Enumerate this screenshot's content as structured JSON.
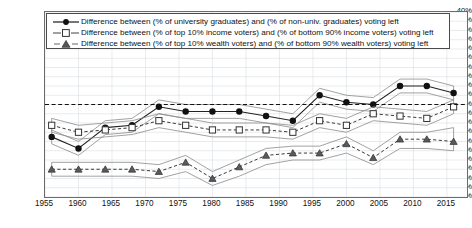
{
  "legend": {
    "entries": [
      {
        "label": "Difference between (% of university graduates) and (% of non-univ. graduates) voting left",
        "marker": "filled-circle-icon",
        "line": "solid"
      },
      {
        "label": "Difference between (% of top 10% income voters) and (% of bottom 90% income voters) voting left",
        "marker": "open-square-icon",
        "line": "dashed"
      },
      {
        "label": "Difference between (% of top 10% wealth voters) and (% of bottom 90% wealth voters) voting left",
        "marker": "filled-triangle-icon",
        "line": "dashed"
      }
    ],
    "position": "top-left-inside"
  },
  "axes": {
    "y_ticks": [
      "40%",
      "36%",
      "32%",
      "28%",
      "24%",
      "20%",
      "16%",
      "12%",
      "8%",
      "4%",
      "0%",
      "-4%",
      "-8%",
      "-12%",
      "-16%",
      "-20%",
      "-24%",
      "-28%",
      "-32%",
      "-36%",
      "-40%"
    ],
    "x_ticks": [
      "1955",
      "1960",
      "1965",
      "1970",
      "1975",
      "1980",
      "1985",
      "1990",
      "1995",
      "2000",
      "2005",
      "2010",
      "2015"
    ]
  },
  "chart_data": {
    "type": "line",
    "title": "",
    "xlabel": "",
    "ylabel": "",
    "ylim": [
      -40,
      40
    ],
    "xlim": [
      1955,
      2018
    ],
    "ytick_step": 4,
    "grid": true,
    "zero_line": true,
    "zero_line_style": "dashed",
    "legend_position": "top-left-inside",
    "colors": {
      "line": "#222222",
      "band": "#8a8a8a",
      "grid": "#d9dde3",
      "frame": "#6b6b6b"
    },
    "series": [
      {
        "name": "Difference between (% of university graduates) and (% of non-univ. graduates) voting left",
        "marker": "filled-circle",
        "line": "solid",
        "x": [
          1956,
          1960,
          1964,
          1968,
          1972,
          1976,
          1980,
          1984,
          1988,
          1992,
          1996,
          2000,
          2004,
          2008,
          2012,
          2016
        ],
        "values": [
          -14,
          -19,
          -10,
          -9,
          -1,
          -3,
          -3,
          -3,
          -5,
          -7,
          4,
          1,
          0,
          8,
          8,
          5
        ],
        "band_upper": [
          -11,
          -16,
          -7,
          -6,
          2,
          0,
          0,
          0,
          -2,
          -4,
          7,
          4,
          3,
          11,
          11,
          8
        ],
        "band_lower": [
          -17,
          -22,
          -13,
          -12,
          -4,
          -6,
          -6,
          -6,
          -8,
          -10,
          1,
          -2,
          -3,
          5,
          5,
          2
        ]
      },
      {
        "name": "Difference between (% of top 10% income voters) and (% of bottom 90% income voters) voting left",
        "marker": "open-square",
        "line": "dashed",
        "x": [
          1956,
          1960,
          1964,
          1968,
          1972,
          1976,
          1980,
          1984,
          1988,
          1992,
          1996,
          2000,
          2004,
          2008,
          2012,
          2016
        ],
        "values": [
          -9,
          -12,
          -11,
          -10,
          -7,
          -9,
          -11,
          -11,
          -11,
          -12,
          -7,
          -9,
          -4,
          -5,
          -6,
          -1
        ],
        "band_upper": [
          -6,
          -9,
          -8,
          -7,
          -4,
          -6,
          -8,
          -8,
          -8,
          -9,
          -4,
          -6,
          -1,
          -2,
          -3,
          2
        ],
        "band_lower": [
          -12,
          -15,
          -14,
          -13,
          -10,
          -12,
          -14,
          -14,
          -14,
          -15,
          -10,
          -12,
          -7,
          -8,
          -9,
          -4
        ]
      },
      {
        "name": "Difference between (% of top 10% wealth voters) and (% of bottom 90% wealth voters) voting left",
        "marker": "filled-triangle",
        "line": "dashed",
        "x": [
          1956,
          1960,
          1964,
          1968,
          1972,
          1976,
          1980,
          1984,
          1988,
          1992,
          1996,
          2000,
          2004,
          2008,
          2012,
          2016
        ],
        "values": [
          -28,
          -28,
          -28,
          -28,
          -29,
          -25,
          -32,
          -27,
          -22,
          -21,
          -21,
          -17,
          -23,
          -15,
          -15,
          -16
        ],
        "band_upper": [
          -25,
          -25,
          -25,
          -25,
          -26,
          -22,
          -29,
          -24,
          -19,
          -18,
          -18,
          -14,
          -20,
          -12,
          -12,
          -10
        ],
        "band_lower": [
          -31,
          -31,
          -31,
          -31,
          -32,
          -29,
          -35,
          -31,
          -26,
          -24,
          -24,
          -21,
          -26,
          -19,
          -19,
          -20
        ]
      }
    ]
  }
}
